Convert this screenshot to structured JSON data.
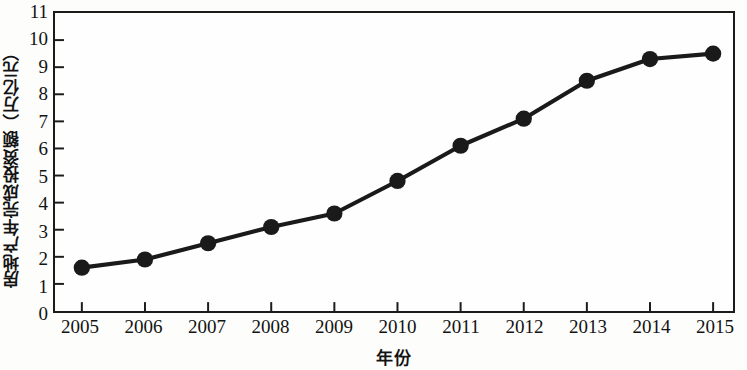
{
  "chart_data": {
    "type": "line",
    "title": "",
    "xlabel": "年份",
    "ylabel": "房地产年完成投资额（万亿元）",
    "categories": [
      "2005",
      "2006",
      "2007",
      "2008",
      "2009",
      "2010",
      "2011",
      "2012",
      "2013",
      "2014",
      "2015"
    ],
    "values": [
      1.6,
      1.9,
      2.5,
      3.1,
      3.6,
      4.8,
      6.1,
      7.1,
      8.5,
      9.3,
      9.5
    ],
    "series": [
      {
        "name": "房地产年完成投资额",
        "values": [
          1.6,
          1.9,
          2.5,
          3.1,
          3.6,
          4.8,
          6.1,
          7.1,
          8.5,
          9.3,
          9.5
        ]
      }
    ],
    "xlim": [
      2004.6,
      2015.5
    ],
    "ylim": [
      0,
      11
    ],
    "y_ticks": [
      0,
      1,
      2,
      3,
      4,
      5,
      6,
      7,
      8,
      9,
      10,
      11
    ],
    "y_tick_labels": [
      "0",
      "1",
      "2",
      "3",
      "4",
      "5",
      "6",
      "7",
      "8",
      "9",
      "10",
      "11"
    ],
    "x_ticks": [
      "2005",
      "2006",
      "2007",
      "2008",
      "2009",
      "2010",
      "2011",
      "2012",
      "2013",
      "2014",
      "2015"
    ],
    "grid": false,
    "legend": null,
    "line_color": "#1a1a1a",
    "marker_color": "#1a1a1a",
    "marker": "circle",
    "axis_color": "#1b1b1b",
    "background_color": "#fefefe"
  }
}
